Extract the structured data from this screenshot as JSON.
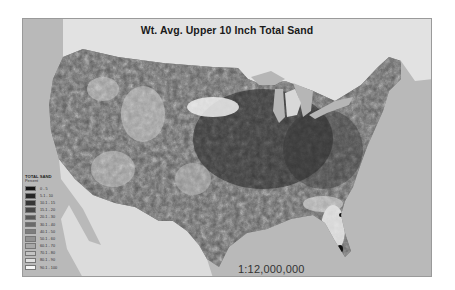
{
  "map": {
    "title": "Wt. Avg. Upper 10 Inch Total Sand",
    "scale": "1:12,000,000",
    "attribution": "",
    "colors": {
      "ocean": "#b9b9b9",
      "canada": "#e2e2e2",
      "mexico": "#dcdcdc",
      "lakes": "#b6b6b6",
      "land_base": "#5a5a5a"
    }
  },
  "legend": {
    "title": "TOTAL SAND",
    "subtitle": "Percent",
    "classes": [
      {
        "label": "0 - 5",
        "color": "#141414"
      },
      {
        "label": "5.1 - 10",
        "color": "#262626"
      },
      {
        "label": "10.1 - 15",
        "color": "#363636"
      },
      {
        "label": "15.1 - 20",
        "color": "#474747"
      },
      {
        "label": "20.1 - 30",
        "color": "#585858"
      },
      {
        "label": "30.1 - 40",
        "color": "#6a6a6a"
      },
      {
        "label": "40.1 - 50",
        "color": "#7d7d7d"
      },
      {
        "label": "50.1 - 60",
        "color": "#929292"
      },
      {
        "label": "60.1 - 70",
        "color": "#a8a8a8"
      },
      {
        "label": "70.1 - 80",
        "color": "#c4c4c4"
      },
      {
        "label": "80.1 - 90",
        "color": "#e0e0e0"
      },
      {
        "label": "90.1 - 100",
        "color": "#f7f7f7"
      }
    ]
  }
}
